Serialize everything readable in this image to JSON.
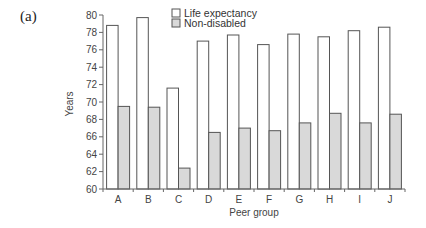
{
  "panel_label": "(a)",
  "chart_data": {
    "type": "bar",
    "title": "",
    "xlabel": "Peer group",
    "ylabel": "Years",
    "ylim": [
      60,
      80
    ],
    "yticks": [
      60,
      62,
      64,
      66,
      68,
      70,
      72,
      74,
      76,
      78,
      80
    ],
    "grid": false,
    "legend_position": "top-center",
    "categories": [
      "A",
      "B",
      "C",
      "D",
      "E",
      "F",
      "G",
      "H",
      "I",
      "J"
    ],
    "series": [
      {
        "name": "Life expectancy",
        "color": "#ffffff",
        "values": [
          78.8,
          79.7,
          71.6,
          77.0,
          77.7,
          76.6,
          77.8,
          77.5,
          78.2,
          78.6
        ]
      },
      {
        "name": "Non-disabled",
        "color": "#d9d9d9",
        "values": [
          69.5,
          69.4,
          62.4,
          66.5,
          67.0,
          66.7,
          67.6,
          68.7,
          67.6,
          68.6
        ]
      }
    ]
  },
  "style": {
    "axis_color": "#666666",
    "bar_stroke": "#555555"
  }
}
